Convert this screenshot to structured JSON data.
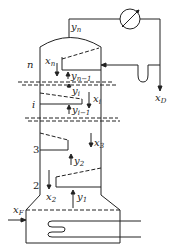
{
  "diagram": {
    "stages": [
      {
        "label": "n",
        "liquid": "x",
        "liquid_sub": "n",
        "vapor_in": "y",
        "vapor_in_sub": "n−1"
      },
      {
        "label": "i",
        "liquid": "x",
        "liquid_sub": "i",
        "vapor_out": "y",
        "vapor_out_sub": "i",
        "vapor_in": "y",
        "vapor_in_sub": "i−1"
      },
      {
        "label": "3",
        "liquid": "x",
        "liquid_sub": "3",
        "vapor_in": "y",
        "vapor_in_sub": "2"
      },
      {
        "label": "2",
        "liquid": "x",
        "liquid_sub": "2",
        "vapor_in": "y",
        "vapor_in_sub": "1"
      }
    ],
    "top_vapor": {
      "main": "y",
      "sub": "n"
    },
    "distillate": {
      "main": "x",
      "sub": "D"
    },
    "feed": {
      "main": "x",
      "sub": "F"
    },
    "components": [
      "condenser",
      "reflux-trap",
      "reboiler",
      "heating-coil"
    ],
    "colors": {
      "line": "#222222",
      "background": "#ffffff"
    }
  }
}
